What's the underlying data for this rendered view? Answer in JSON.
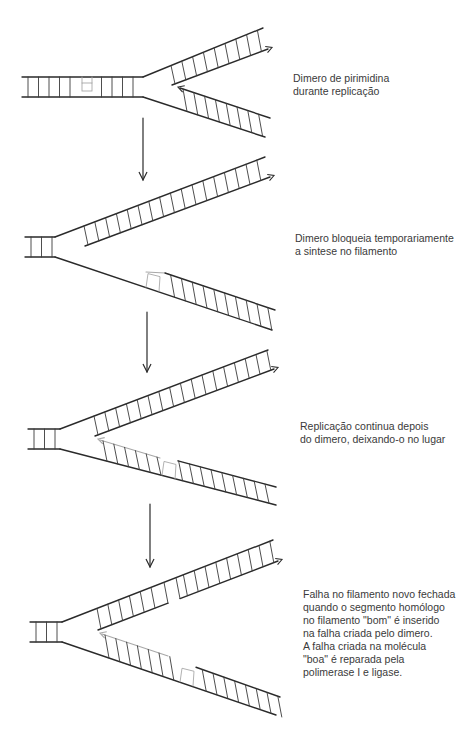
{
  "figure": {
    "header_fragment": "",
    "stages": [
      {
        "id": "stage-1",
        "caption": "Dimero de pirimidina\ndurante replicação",
        "caption_pos": [
          293,
          72
        ],
        "duplex": {
          "x1": 22,
          "x2": 143,
          "y_top": 77,
          "y_bot": 97,
          "dimer_x": 82
        },
        "upper_outer": [
          [
            143,
            77
          ],
          [
            263,
            28
          ]
        ],
        "upper_inner": {
          "from": [
            172,
            85
          ],
          "to": [
            268,
            49
          ],
          "arrow": "end",
          "gaps": []
        },
        "lower_outer": [
          [
            143,
            97
          ],
          [
            265,
            137
          ]
        ],
        "lower_inner": {
          "from": [
            180,
            88
          ],
          "to": [
            270,
            118
          ],
          "arrow": "start",
          "grey_segments": [],
          "dimer_box": null
        }
      },
      {
        "id": "stage-2",
        "caption": "Dimero bloqueia temporariamente\na sintese no filamento",
        "caption_pos": [
          295,
          232
        ],
        "duplex": {
          "x1": 25,
          "x2": 55,
          "y_top": 237,
          "y_bot": 257,
          "dimer_x": null
        },
        "upper_outer": [
          [
            55,
            237
          ],
          [
            265,
            157
          ]
        ],
        "upper_inner": {
          "from": [
            85,
            246
          ],
          "to": [
            270,
            177
          ],
          "arrow": "end",
          "gaps": []
        },
        "lower_outer": [
          [
            55,
            257
          ],
          [
            272,
            330
          ]
        ],
        "lower_inner": {
          "from": [
            165,
            273
          ],
          "to": [
            275,
            310
          ],
          "arrow": "none",
          "grey_segments": [
            [
              [
                146,
                272
              ],
              [
                165,
                273
              ]
            ]
          ],
          "dimer_box": [
            146,
            270
          ]
        }
      },
      {
        "id": "stage-3",
        "caption": "Replicação continua depois\ndo dimero, deixando-o no lugar",
        "caption_pos": [
          300,
          420
        ],
        "duplex": {
          "x1": 28,
          "x2": 60,
          "y_top": 429,
          "y_bot": 449,
          "dimer_x": null
        },
        "upper_outer": [
          [
            60,
            429
          ],
          [
            268,
            350
          ]
        ],
        "upper_inner": {
          "from": [
            95,
            436
          ],
          "to": [
            274,
            369
          ],
          "arrow": "end",
          "gaps": []
        },
        "lower_outer": [
          [
            60,
            449
          ],
          [
            276,
            505
          ]
        ],
        "lower_inner": {
          "from": [
            100,
            440
          ],
          "to": [
            276,
            487
          ],
          "arrow": "start",
          "grey_segments": [
            [
              [
                100,
                440
              ],
              [
                160,
                458
              ]
            ]
          ],
          "gap": [
            158,
            180
          ],
          "dimer_box": [
            162,
            466
          ]
        }
      },
      {
        "id": "stage-4",
        "caption": "Falha no filamento novo fechada\nquando o segmento homólogo\nno filamento \"bom\" é inserido\nna falha criada pelo dimero.\nA falha criada na molécula\n\"boa\" é reparada pela\npolimerase I e ligase.",
        "caption_pos": [
          303,
          588
        ],
        "duplex": {
          "x1": 30,
          "x2": 62,
          "y_top": 622,
          "y_bot": 642,
          "dimer_x": null
        },
        "upper_outer": [
          [
            62,
            622
          ],
          [
            273,
            540
          ]
        ],
        "upper_inner": {
          "from": [
            98,
            630
          ],
          "to": [
            278,
            561
          ],
          "arrow": "end",
          "gaps": [
            [
              168,
              180
            ]
          ]
        },
        "lower_outer": [
          [
            62,
            642
          ],
          [
            276,
            715
          ]
        ],
        "lower_inner": {
          "from": [
            102,
            634
          ],
          "to": [
            280,
            697
          ],
          "arrow": "start",
          "grey_segments": [
            [
              [
                102,
                634
              ],
              [
                168,
                656
              ]
            ]
          ],
          "dimer_box": [
            180,
            668
          ]
        }
      }
    ],
    "transition_arrows": [
      {
        "x": 143,
        "y1": 118,
        "y2": 180
      },
      {
        "x": 147,
        "y1": 312,
        "y2": 372
      },
      {
        "x": 150,
        "y1": 504,
        "y2": 567
      }
    ],
    "colors": {
      "strand": "#2a2a2a",
      "rung": "#3a3a3a",
      "grey": "#a8a8a8",
      "text": "#3a3a3a"
    }
  }
}
